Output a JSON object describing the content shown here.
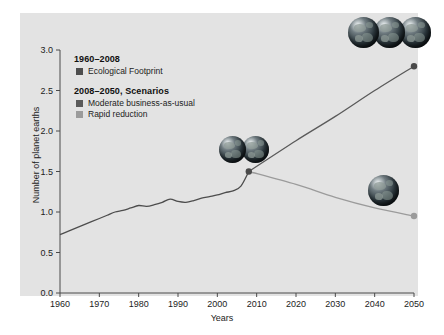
{
  "chart_data": {
    "type": "line",
    "title": "",
    "xlabel": "Years",
    "ylabel": "Number of planet earths",
    "xlim": [
      1960,
      2050
    ],
    "ylim": [
      0.0,
      3.0
    ],
    "xticks": [
      1960,
      1970,
      1980,
      1990,
      2000,
      2010,
      2020,
      2030,
      2040,
      2050
    ],
    "xtick_labels": [
      "1960",
      "1970",
      "1980",
      "1990",
      "2000",
      "2010",
      "2020",
      "2030",
      "2040",
      "2050"
    ],
    "yticks": [
      0.0,
      0.5,
      1.0,
      1.5,
      2.0,
      2.5,
      3.0
    ],
    "ytick_labels": [
      "0.0",
      "0.5",
      "1.0",
      "1.5",
      "2.0",
      "2.5",
      "3.0"
    ],
    "grid": false,
    "legend_position": "upper-left-inside",
    "series": [
      {
        "name": "Ecological Footprint",
        "period": "1960–2008",
        "color": "#4d4d4d",
        "x": [
          1960,
          1962,
          1964,
          1966,
          1968,
          1970,
          1972,
          1974,
          1976,
          1978,
          1980,
          1982,
          1984,
          1986,
          1988,
          1990,
          1992,
          1994,
          1996,
          1998,
          2000,
          2002,
          2004,
          2006,
          2008
        ],
        "values": [
          0.72,
          0.76,
          0.8,
          0.84,
          0.88,
          0.92,
          0.96,
          1.0,
          1.02,
          1.05,
          1.08,
          1.07,
          1.09,
          1.12,
          1.16,
          1.13,
          1.12,
          1.14,
          1.17,
          1.19,
          1.21,
          1.24,
          1.26,
          1.32,
          1.5
        ]
      },
      {
        "name": "Moderate business-as-usual",
        "period": "2008–2050, Scenarios",
        "color": "#5a5a5a",
        "x": [
          2008,
          2020,
          2030,
          2040,
          2050
        ],
        "values": [
          1.5,
          1.88,
          2.18,
          2.5,
          2.8
        ]
      },
      {
        "name": "Rapid reduction",
        "period": "2008–2050, Scenarios",
        "color": "#9b9b9b",
        "x": [
          2008,
          2020,
          2030,
          2040,
          2050
        ],
        "values": [
          1.5,
          1.34,
          1.18,
          1.05,
          0.95
        ]
      }
    ],
    "markers": [
      {
        "label": "branch-point",
        "x": 2008,
        "y": 1.5,
        "style": "dark"
      },
      {
        "label": "business-as-usual-endpoint",
        "x": 2050,
        "y": 2.8,
        "style": "dark"
      },
      {
        "label": "rapid-reduction-endpoint",
        "x": 2050,
        "y": 0.95,
        "style": "light"
      }
    ],
    "annotations": [
      {
        "name": "three-earths-globes",
        "count": 3,
        "near_x": 2050,
        "near_y": 2.8
      },
      {
        "name": "one-and-half-earths-globes",
        "count": 2,
        "near_x": 2008,
        "near_y": 1.5
      },
      {
        "name": "one-earth-globe",
        "count": 1,
        "near_x": 2046,
        "near_y": 1.2
      }
    ]
  },
  "legend": {
    "group_historical": {
      "heading": "1960–2008",
      "items": [
        {
          "label": "Ecological Footprint",
          "color": "#4d4d4d"
        }
      ]
    },
    "group_scenarios": {
      "heading": "2008–2050, Scenarios",
      "items": [
        {
          "label": "Moderate business-as-usual",
          "color": "#5a5a5a"
        },
        {
          "label": "Rapid reduction",
          "color": "#9b9b9b"
        }
      ]
    }
  },
  "axes": {
    "y_title": "Number of planet earths",
    "x_title": "Years"
  }
}
